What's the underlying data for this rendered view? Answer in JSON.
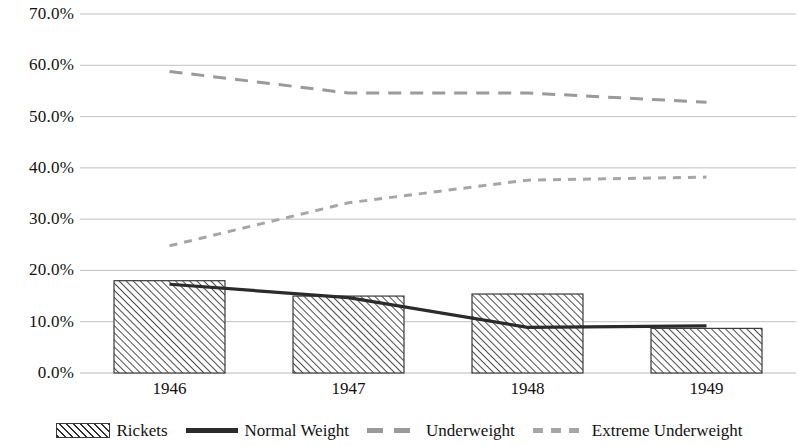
{
  "chart_data": {
    "type": "bar",
    "title": "",
    "subtitle": "",
    "xlabel": "",
    "ylabel": "",
    "categories": [
      "1946",
      "1947",
      "1948",
      "1949"
    ],
    "ylim": [
      0,
      0.7
    ],
    "y_ticks": [
      "0.0%",
      "10.0%",
      "20.0%",
      "30.0%",
      "40.0%",
      "50.0%",
      "60.0%",
      "70.0%"
    ],
    "y_tick_values": [
      0,
      10,
      20,
      30,
      40,
      50,
      60,
      70
    ],
    "grid": true,
    "legend_position": "bottom",
    "series": [
      {
        "name": "Rickets",
        "kind": "bar",
        "style": "hatched",
        "color": "#2e2e2e",
        "values": [
          18.0,
          15.0,
          15.4,
          8.7
        ]
      },
      {
        "name": "Normal Weight",
        "kind": "line",
        "style": "solid",
        "color": "#2b2b2b",
        "values": [
          17.3,
          14.7,
          8.9,
          9.2
        ]
      },
      {
        "name": "Underweight",
        "kind": "line",
        "style": "dashed",
        "color": "#9a9a9a",
        "values": [
          58.8,
          54.6,
          54.6,
          52.8
        ]
      },
      {
        "name": "Extreme Underweight",
        "kind": "line",
        "style": "dotted-dashed",
        "color": "#a6a6a6",
        "values": [
          24.8,
          33.2,
          37.6,
          38.2
        ]
      }
    ]
  },
  "legend": {
    "items": [
      {
        "label": "Rickets",
        "swatch": "hatched-bar-swatch"
      },
      {
        "label": "Normal Weight",
        "swatch": "solid-line-swatch"
      },
      {
        "label": "Underweight",
        "swatch": "dashed-line-swatch"
      },
      {
        "label": "Extreme Underweight",
        "swatch": "dotted-line-swatch"
      }
    ]
  }
}
